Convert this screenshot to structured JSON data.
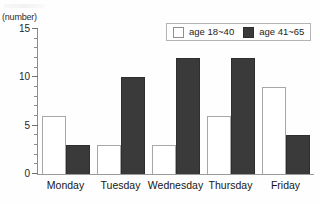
{
  "chart_data": {
    "type": "bar",
    "title": "",
    "subtitle": "",
    "xlabel": "",
    "ylabel": "(number)",
    "ylim": [
      0,
      15
    ],
    "ytick_labels": [
      "0",
      "5",
      "10",
      "15"
    ],
    "ytick_values": [
      0,
      5,
      10,
      15
    ],
    "minor_tick_step": 1,
    "grid": false,
    "legend_position": "top-right",
    "categories": [
      "Monday",
      "Tuesday",
      "Wednesday",
      "Thursday",
      "Friday"
    ],
    "series": [
      {
        "name": "age 18~40",
        "color": "#ffffff",
        "values": [
          6,
          3,
          3,
          6,
          9
        ]
      },
      {
        "name": "age 41~65",
        "color": "#3a3a3a",
        "values": [
          3,
          10,
          12,
          12,
          4
        ]
      }
    ]
  },
  "axis": {
    "y_unit_label": "(number)"
  },
  "legend": {
    "entries": [
      {
        "label": "age 18~40",
        "swatch": "light-swatch-icon"
      },
      {
        "label": "age 41~65",
        "swatch": "dark-swatch-icon"
      }
    ]
  },
  "ticks": {
    "labels": [
      "15",
      "10",
      "5",
      "0"
    ]
  }
}
